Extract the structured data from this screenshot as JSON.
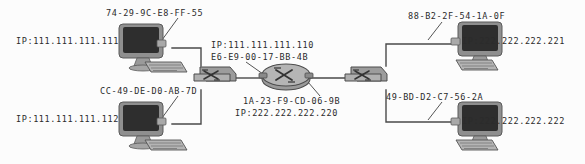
{
  "diagram": {
    "background": "#fcfcfc",
    "wire_color": "#4a4a4a",
    "text_color": "#2b2b2b"
  },
  "nodes": [
    {
      "id": "pc-a",
      "kind": "computer-icon",
      "x": 115,
      "y": 22,
      "w": 78,
      "h": 50,
      "mac": "74-29-9C-E8-FF-55",
      "ip": "IP:111.111.111.111"
    },
    {
      "id": "pc-b",
      "kind": "computer-icon",
      "x": 115,
      "y": 100,
      "w": 78,
      "h": 50,
      "mac": "CC-49-DE-D0-AB-7D",
      "ip": "IP:111.111.111.112"
    },
    {
      "id": "switch-left",
      "kind": "switch-icon",
      "x": 194,
      "y": 66,
      "w": 40,
      "h": 24
    },
    {
      "id": "router",
      "kind": "router-icon",
      "x": 259,
      "y": 62,
      "w": 52,
      "h": 30,
      "left_ip": "IP:111.111.111.110",
      "left_mac": "E6-E9-00-17-BB-4B",
      "right_mac": "1A-23-F9-CD-06-9B",
      "right_ip": "IP:222.222.222.220"
    },
    {
      "id": "switch-right",
      "kind": "switch-icon",
      "x": 345,
      "y": 66,
      "w": 40,
      "h": 24
    },
    {
      "id": "pc-c",
      "kind": "computer-icon",
      "x": 415,
      "y": 20,
      "w": 78,
      "h": 50,
      "mac": "88-B2-2F-54-1A-0F",
      "ip": "IP:222.222.222.221"
    },
    {
      "id": "pc-d",
      "kind": "computer-icon",
      "x": 415,
      "y": 100,
      "w": 78,
      "h": 50,
      "mac": "49-BD-D2-C7-56-2A",
      "ip": "IP:222.222.222.222"
    }
  ],
  "labels": {
    "pc_a_mac": "74-29-9C-E8-FF-55",
    "pc_a_ip": "IP:111.111.111.111",
    "pc_b_mac": "CC-49-DE-D0-AB-7D",
    "pc_b_ip": "IP:111.111.111.112",
    "router_left_ip": "IP:111.111.111.110",
    "router_left_mac": "E6-E9-00-17-BB-4B",
    "router_right_mac": "1A-23-F9-CD-06-9B",
    "router_right_ip": "IP:222.222.222.220",
    "pc_c_mac": "88-B2-2F-54-1A-0F",
    "pc_c_ip": "IP:222.222.222.221",
    "pc_d_mac": "49-BD-D2-C7-56-2A",
    "pc_d_ip": "IP:222.222.222.222"
  }
}
